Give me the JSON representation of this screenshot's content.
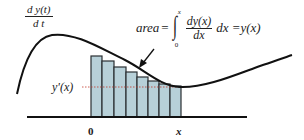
{
  "diagram": {
    "title_fraction": {
      "numerator": "d y(t)",
      "denominator": "d t"
    },
    "equation": {
      "lhs": "area",
      "equals": "=",
      "integral_upper": "x",
      "integral_lower": "0",
      "integrand_numerator": "dy(x)",
      "integrand_denominator": "dx",
      "differential": "dx",
      "rhs": "=y(x)"
    },
    "derivative_label": "y'(x)",
    "axis_labels": {
      "origin": "0",
      "end": "x"
    },
    "colors": {
      "curve": "#111111",
      "bar_fill": "#b7d0d8",
      "bar_stroke": "#2a2f33",
      "axis": "#111111",
      "dotted_line": "#c0392b",
      "arrow": "#111111"
    },
    "bars": [
      {
        "x": 91,
        "w": 11,
        "top": 56
      },
      {
        "x": 102,
        "w": 12,
        "top": 61
      },
      {
        "x": 114,
        "w": 12,
        "top": 67
      },
      {
        "x": 126,
        "w": 11,
        "top": 72
      },
      {
        "x": 137,
        "w": 11,
        "top": 77
      },
      {
        "x": 148,
        "w": 11,
        "top": 81
      },
      {
        "x": 159,
        "w": 11,
        "top": 84
      },
      {
        "x": 170,
        "w": 11,
        "top": 86
      }
    ],
    "baseline_y": 117
  }
}
